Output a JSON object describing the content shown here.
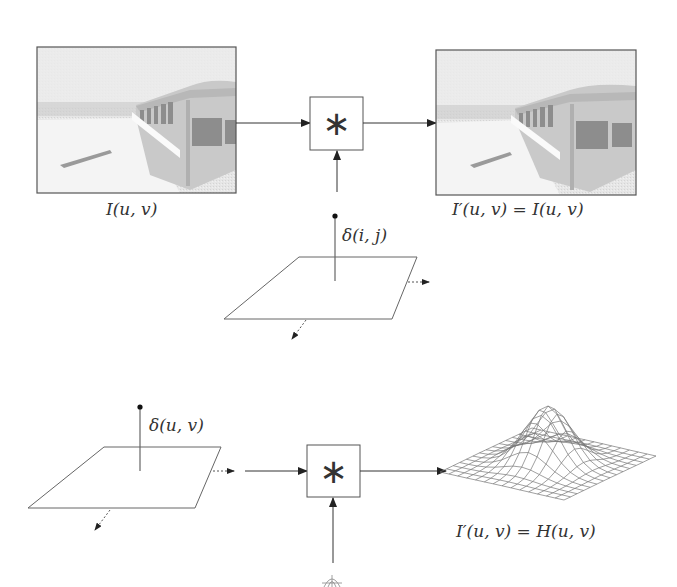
{
  "diagram": {
    "top": {
      "input_image": {
        "label": "I(u, v)",
        "content": "photo of an abandoned bus in snow"
      },
      "operator": {
        "symbol": "∗",
        "name": "convolution"
      },
      "kernel": {
        "label": "δ(i, j)",
        "type": "discrete impulse on plane"
      },
      "output_image": {
        "label": "I′(u, v) = I(u, v)",
        "content": "identical photo of an abandoned bus in snow"
      }
    },
    "bottom": {
      "input": {
        "label": "δ(u, v)",
        "type": "impulse on plane"
      },
      "operator": {
        "symbol": "∗",
        "name": "convolution"
      },
      "kernel": {
        "type": "small filter surface (partially visible)"
      },
      "output": {
        "label": "I′(u, v) = H(u, v)",
        "type": "3D gaussian-like wireframe surface"
      }
    },
    "colors": {
      "line": "#333333",
      "frame": "#555555",
      "photo_bg": "#e8e8e8"
    }
  }
}
